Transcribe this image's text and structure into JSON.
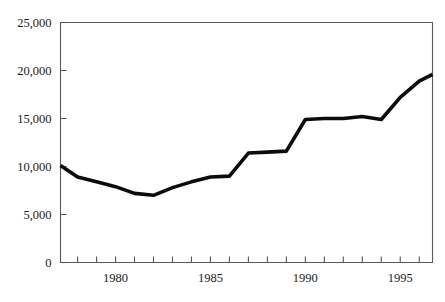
{
  "chart_data": {
    "type": "line",
    "title": "",
    "subtitle": "",
    "xlabel": "",
    "ylabel": "",
    "xlim": [
      1977.1,
      1996.7
    ],
    "ylim": [
      0,
      25000
    ],
    "grid": false,
    "legend": false,
    "legend_position": "none",
    "y_ticks": [
      0,
      5000,
      10000,
      15000,
      20000,
      25000
    ],
    "y_tick_labels": [
      "0",
      "5,000",
      "10,000",
      "15,000",
      "20,000",
      "25,000"
    ],
    "x_tick_values": [
      1977,
      1978,
      1979,
      1980,
      1981,
      1982,
      1983,
      1984,
      1985,
      1986,
      1987,
      1988,
      1989,
      1990,
      1991,
      1992,
      1993,
      1994,
      1995,
      1996
    ],
    "x_tick_labels": [
      "1980",
      "1985",
      "1990",
      "1995"
    ],
    "x_labeled_values": [
      1980,
      1985,
      1990,
      1995
    ],
    "series": [
      {
        "name": "series-1",
        "color": "#0b0b0b",
        "x": [
          1977.1,
          1978,
          1979,
          1980,
          1981,
          1982,
          1983,
          1984,
          1985,
          1986,
          1987,
          1988,
          1989,
          1990,
          1991,
          1992,
          1993,
          1994,
          1995,
          1996,
          1996.7
        ],
        "values": [
          10100,
          8900,
          8400,
          7900,
          7200,
          7000,
          7800,
          8400,
          8900,
          9000,
          11400,
          11500,
          11600,
          14900,
          15000,
          15000,
          15200,
          14900,
          17200,
          18900,
          19600
        ]
      }
    ]
  },
  "axes": {
    "y_axis_name": "y-axis",
    "x_axis_name": "x-axis"
  }
}
